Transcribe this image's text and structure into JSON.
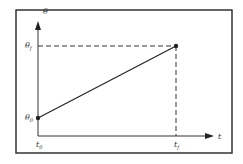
{
  "diagram": {
    "y_axis_label": "θ",
    "x_axis_label": "t",
    "y_start_label": "θ",
    "y_start_sub": "0",
    "y_final_label": "θ",
    "y_final_sub": "f",
    "x_start_label": "t",
    "x_start_sub": "0",
    "x_final_label": "t",
    "x_final_sub": "f",
    "colors": {
      "line": "#222222",
      "frame": "#333333",
      "background": "#ffffff"
    }
  }
}
